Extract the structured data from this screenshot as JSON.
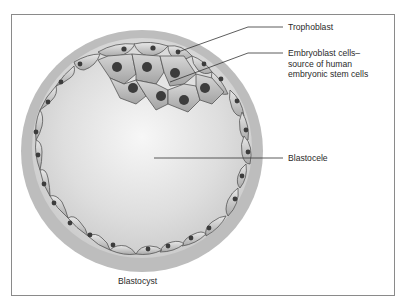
{
  "figure": {
    "caption": "Blastocyst",
    "labels": {
      "trophoblast": "Trophoblast",
      "embryoblast_line1": "Embryoblast cells–",
      "embryoblast_line2": "source of human",
      "embryoblast_line3": "embryonic stem cells",
      "blastocele": "Blastocele"
    }
  },
  "colors": {
    "frame_border": "#8a8a8a",
    "zona": "#bdbdbd",
    "cavity_center": "#f4f4f4",
    "cavity_edge": "#c9c9c9",
    "cell_fill": "#c4c4c4",
    "cell_stroke": "#555555",
    "nucleus": "#3c3c3c",
    "leader_line": "#333333"
  }
}
